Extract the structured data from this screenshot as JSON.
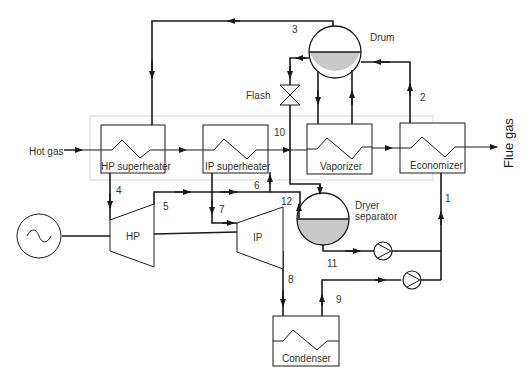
{
  "diagram": {
    "type": "process-flow-diagram",
    "components": {
      "hp_superheater": "HP superheater",
      "ip_superheater": "IP superheater",
      "vaporizer": "Vaporizer",
      "economizer": "Economizer",
      "drum": "Drum",
      "flash": "Flash",
      "dryer_separator_line1": "Dryer",
      "dryer_separator_line2": "separator",
      "hp_turbine": "HP",
      "ip_turbine": "IP",
      "condenser": "Condenser",
      "generator_symbol": "~"
    },
    "streams": {
      "hot_gas": "Hot gas",
      "flue_gas": "Flue gas"
    },
    "state_points": [
      "1",
      "2",
      "3",
      "4",
      "5",
      "6",
      "7",
      "8",
      "9",
      "10",
      "11",
      "12"
    ],
    "colors": {
      "line": "#1a1a1a",
      "liquid_fill": "#c8c8c8",
      "hrsg_boundary": "#d8d8d8",
      "background": "#ffffff"
    }
  }
}
